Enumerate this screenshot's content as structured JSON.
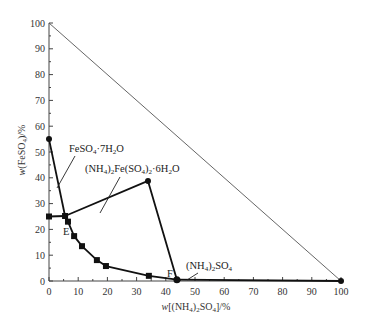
{
  "chart_data": {
    "type": "line",
    "title": "",
    "xlabel": "w[(NH4)2SO4]/%",
    "ylabel": "w(FeSO4)/%",
    "xlim": [
      0,
      100
    ],
    "ylim": [
      0,
      100
    ],
    "grid": false,
    "legend": "none",
    "x_ticks": [
      "0",
      "10",
      "20",
      "30",
      "40",
      "50",
      "60",
      "70",
      "80",
      "90",
      "100"
    ],
    "y_ticks": [
      "0",
      "10",
      "20",
      "30",
      "40",
      "50",
      "60",
      "70",
      "80",
      "90",
      "100"
    ],
    "series": [
      {
        "name": "FeSO4·7H2O saturation curve",
        "points": [
          [
            0,
            55
          ],
          [
            5.5,
            25.2
          ]
        ]
      },
      {
        "name": "(NH4)2Fe(SO4)2·6H2O saturation curve",
        "points": [
          [
            5.5,
            25.2
          ],
          [
            6.5,
            23.0
          ],
          [
            8.6,
            17.4
          ],
          [
            11.3,
            13.5
          ],
          [
            16.4,
            8.1
          ],
          [
            19.5,
            5.8
          ],
          [
            34.2,
            2.0
          ],
          [
            43.8,
            0.5
          ]
        ]
      },
      {
        "name": "(NH4)2SO4 saturation curve",
        "points": [
          [
            43.8,
            0.5
          ],
          [
            100,
            0
          ]
        ]
      },
      {
        "name": "Tie line to double salt",
        "points": [
          [
            0,
            25
          ],
          [
            5.5,
            25.2
          ],
          [
            33.9,
            38.8
          ],
          [
            43.8,
            0.5
          ]
        ]
      },
      {
        "name": "Triangle hypotenuse",
        "points": [
          [
            0,
            100
          ],
          [
            100,
            0
          ]
        ]
      }
    ],
    "annotations": [
      {
        "text": "FeSO4·7H2O",
        "x": 7.5,
        "y": 49.5
      },
      {
        "text": "(NH4)2Fe(SO4)2·6H2O",
        "x": 17.5,
        "y": 43
      },
      {
        "text": "(NH4)2SO4",
        "x": 46,
        "y": 4.5
      },
      {
        "text": "E",
        "x": 5.5,
        "y": 19.5
      },
      {
        "text": "F",
        "x": 41,
        "y": 2.5
      }
    ]
  },
  "labels": {
    "x_title_prefix": "w",
    "x_title_body": "[(NH",
    "x_title_sub1": "4",
    "x_title_mid": ")",
    "x_title_sub2": "2",
    "x_title_end": "SO",
    "x_title_sub3": "4",
    "x_title_close": "]/%",
    "y_title_prefix": "w",
    "y_title_body": "(FeSO",
    "y_title_sub": "4",
    "y_title_close": ")/%",
    "point_e": "E",
    "point_f": "F",
    "annot_fe7": {
      "a": "FeSO",
      "s1": "4",
      "b": "·7H",
      "s2": "2",
      "c": "O"
    },
    "annot_double": {
      "a": "(NH",
      "s1": "4",
      "b": ")",
      "s2": "2",
      "c": "Fe(SO",
      "s3": "4",
      "d": ")",
      "s4": "2",
      "e": "·6H",
      "s5": "2",
      "f": "O"
    },
    "annot_as": {
      "a": "(NH",
      "s1": "4",
      "b": ")",
      "s2": "2",
      "c": "SO",
      "s3": "4"
    }
  }
}
